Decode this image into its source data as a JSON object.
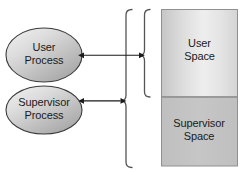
{
  "diagram": {
    "nodes": {
      "user_process": {
        "label_line1": "User",
        "label_line2": "Process",
        "shape": "ellipse",
        "fill_light": "#f0f0f0",
        "fill_dark": "#a8a8a8",
        "stroke": "#3c3c3c"
      },
      "supervisor_process": {
        "label_line1": "Supervisor",
        "label_line2": "Process",
        "shape": "ellipse",
        "fill_light": "#f0f0f0",
        "fill_dark": "#a8a8a8",
        "stroke": "#3c3c3c"
      },
      "user_space": {
        "label_line1": "User",
        "label_line2": "Space",
        "shape": "rectangle",
        "fill_light": "#ececec",
        "fill_dark": "#c4c4c4",
        "stroke": "#8c8c8c"
      },
      "supervisor_space": {
        "label_line1": "Supervisor",
        "label_line2": "Space",
        "shape": "rectangle",
        "fill": "#c2c2c2",
        "stroke": "#8c8c8c"
      }
    },
    "connectors": [
      {
        "name": "user-process-to-user-space",
        "from": "user_process",
        "to": "user_space_bracket",
        "style": "double-headed-arrow"
      },
      {
        "name": "supervisor-process-to-supervisor-space",
        "from": "supervisor_process",
        "to": "supervisor_space_bracket",
        "style": "double-headed-arrow"
      }
    ],
    "brackets": [
      {
        "name": "outer-bracket",
        "spans": "supervisor_space",
        "orientation": "left-facing-curly"
      },
      {
        "name": "inner-bracket",
        "spans": "user_space",
        "orientation": "left-facing-curly"
      }
    ],
    "colors": {
      "stroke": "#3c3c3c",
      "bracket": "#555555",
      "arrow": "#1a1a1a",
      "background": "#ffffff"
    }
  }
}
